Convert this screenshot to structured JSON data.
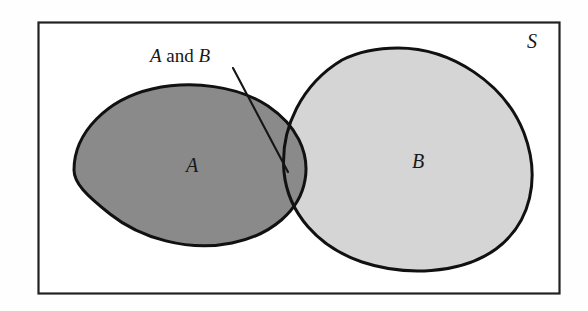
{
  "figure": {
    "type": "venn-diagram",
    "title": "",
    "universe_label": "S",
    "background_color": "#fefefe",
    "frame": {
      "name": "universal-set-rectangle",
      "stroke": "#222222",
      "fill": "#ffffff",
      "x": 38,
      "y": 22,
      "width": 522,
      "height": 272
    },
    "sets": [
      {
        "id": "A",
        "label": "A",
        "fill": "#8a8a8a",
        "stroke": "#111111",
        "label_x": 192,
        "label_y": 172
      },
      {
        "id": "B",
        "label": "B",
        "fill": "#d5d5d5",
        "stroke": "#111111",
        "label_x": 418,
        "label_y": 168
      }
    ],
    "intersection": {
      "id": "A-and-B",
      "label_parts": {
        "first": "A",
        "conjunction": "and",
        "second": "B"
      },
      "label_text": "A and B",
      "fill": "#8a8a8a",
      "leader_line": {
        "x1": 233,
        "y1": 68,
        "x2": 288,
        "y2": 172
      },
      "label_x": 150,
      "label_y": 62
    },
    "universe_label_pos": {
      "x": 532,
      "y": 48
    }
  }
}
